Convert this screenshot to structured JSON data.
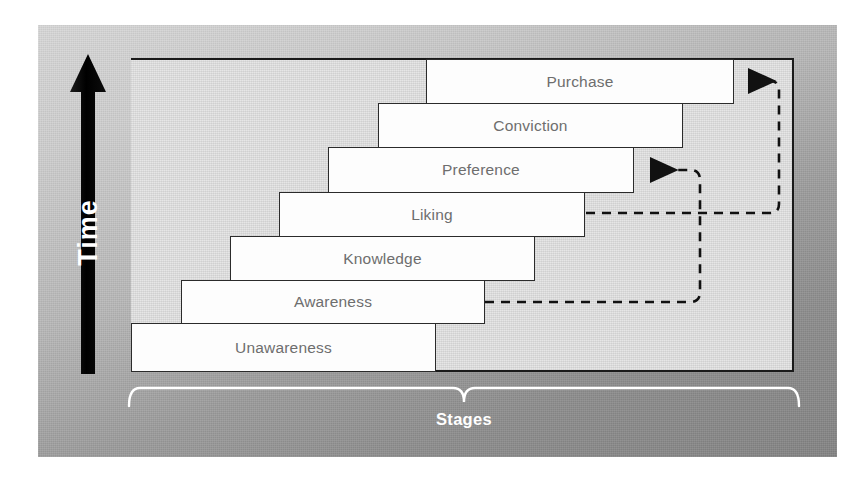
{
  "diagram": {
    "title_axis_vertical": "Time",
    "title_axis_horizontal": "Stages",
    "colors": {
      "step_fill": "#fdfdfd",
      "step_border": "#2b2b2b",
      "step_text": "#6e6e6e",
      "frame_interior": "#e4e4e4",
      "frame_border": "#1a1a1a",
      "panel_gray": "#a8a8a8",
      "axis_arrow": "#000000",
      "axis_text": "#ffffff",
      "feedback_line": "#111111"
    },
    "steps": [
      {
        "label": "Purchase",
        "order": 7
      },
      {
        "label": "Conviction",
        "order": 6
      },
      {
        "label": "Preference",
        "order": 5
      },
      {
        "label": "Liking",
        "order": 4
      },
      {
        "label": "Knowledge",
        "order": 3
      },
      {
        "label": "Awareness",
        "order": 2
      },
      {
        "label": "Unawareness",
        "order": 1
      }
    ],
    "feedback_arrows": [
      {
        "from": "Liking",
        "to": "Purchase",
        "style": "dashed"
      },
      {
        "from": "Awareness",
        "to": "Preference",
        "style": "dashed"
      }
    ]
  }
}
